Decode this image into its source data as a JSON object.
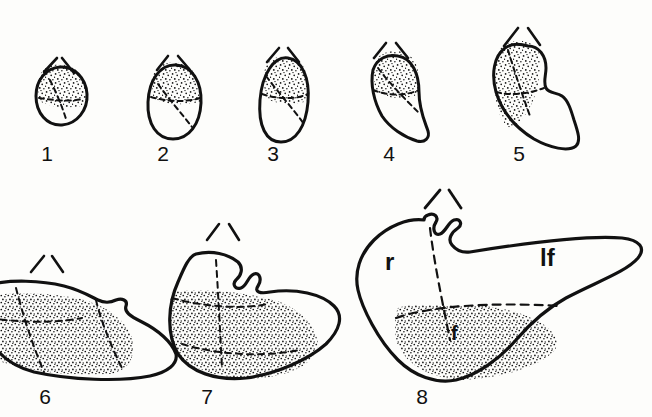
{
  "plate": {
    "title": "Developmental stage series line drawing",
    "background_color": "#fdfdfb",
    "ink_color": "#111111",
    "stipple_color": "#111111",
    "row_count": 2,
    "figure_count": 8
  },
  "stages": [
    {
      "number": "1",
      "row": "top",
      "caret_marker": "caret",
      "outline_style": "solid",
      "stipple": true,
      "dashed_internal_lines": 2,
      "label_x": 47,
      "label_y": 142
    },
    {
      "number": "2",
      "row": "top",
      "caret_marker": "caret",
      "outline_style": "solid",
      "stipple": true,
      "dashed_internal_lines": 2,
      "label_x": 163,
      "label_y": 142
    },
    {
      "number": "3",
      "row": "top",
      "caret_marker": "caret",
      "outline_style": "solid",
      "stipple": true,
      "dashed_internal_lines": 2,
      "label_x": 273,
      "label_y": 142
    },
    {
      "number": "4",
      "row": "top",
      "caret_marker": "caret",
      "outline_style": "solid",
      "stipple": true,
      "dashed_internal_lines": 2,
      "label_x": 389,
      "label_y": 142
    },
    {
      "number": "5",
      "row": "top",
      "caret_marker": "caret",
      "outline_style": "solid",
      "stipple": true,
      "dashed_internal_lines": 2,
      "label_x": 519,
      "label_y": 142
    },
    {
      "number": "6",
      "row": "bottom",
      "caret_marker": "caret",
      "outline_style": "solid",
      "stipple": true,
      "dashed_internal_lines": 3,
      "label_x": 45,
      "label_y": 385
    },
    {
      "number": "7",
      "row": "bottom",
      "caret_marker": "caret",
      "outline_style": "solid",
      "stipple": true,
      "dashed_internal_lines": 3,
      "label_x": 207,
      "label_y": 385
    },
    {
      "number": "8",
      "row": "bottom",
      "caret_marker": "caret",
      "outline_style": "solid",
      "stipple": true,
      "dashed_internal_lines": 2,
      "label_x": 422,
      "label_y": 385
    }
  ],
  "region_labels": [
    {
      "text": "r",
      "x": 385,
      "y": 248,
      "size": "large",
      "stage": "8"
    },
    {
      "text": "lf",
      "x": 540,
      "y": 244,
      "size": "large",
      "stage": "8"
    },
    {
      "text": "f",
      "x": 451,
      "y": 322,
      "size": "small",
      "stage": "8"
    }
  ]
}
